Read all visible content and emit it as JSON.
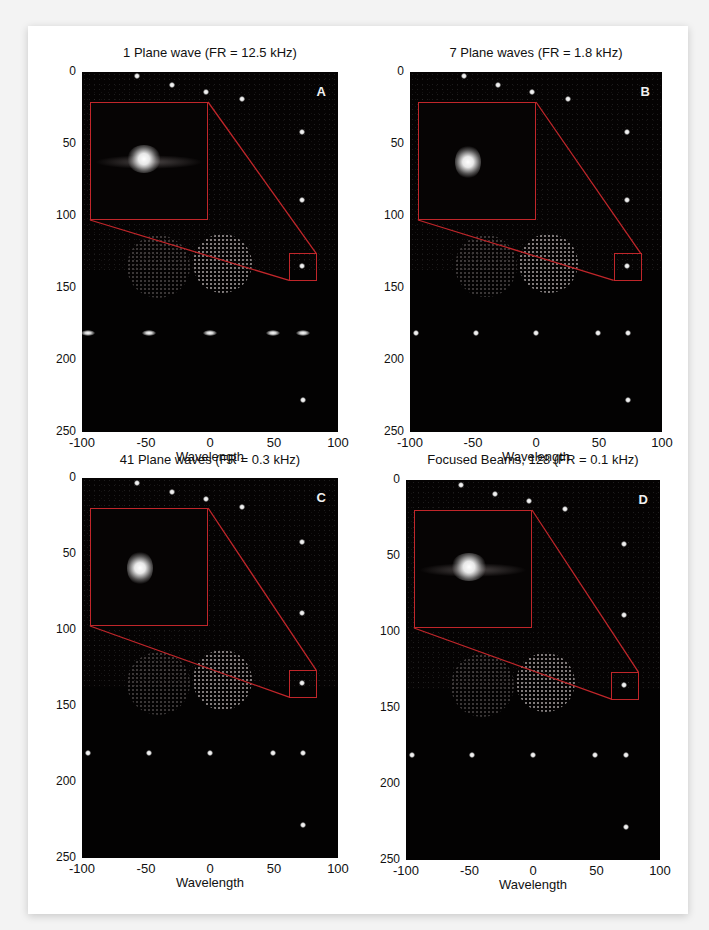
{
  "figure": {
    "panels": [
      {
        "id": "A",
        "letter": "A",
        "title": "1 Plane wave (FR = 12.5 kHz)",
        "xlabel": "Wavelength",
        "inset_style": "sidelobes-wide"
      },
      {
        "id": "B",
        "letter": "B",
        "title": "7 Plane waves (FR = 1.8 kHz)",
        "xlabel": "Wavelength",
        "inset_style": "narrow"
      },
      {
        "id": "C",
        "letter": "C",
        "title": "41 Plane waves (FR = 0.3 kHz)",
        "xlabel": "Wavelength",
        "inset_style": "narrow-clean"
      },
      {
        "id": "D",
        "letter": "D",
        "title": "Focused Beams, 128 (FR = 0.1 kHz)",
        "xlabel": "Wavelength",
        "inset_style": "sidelobes-speckle"
      }
    ],
    "y_ticks": [
      "0",
      "50",
      "100",
      "150",
      "200",
      "250"
    ],
    "x_ticks": [
      "-100",
      "-50",
      "0",
      "50",
      "100"
    ],
    "colors": {
      "inset_border": "#c0262a",
      "image_bg": "#050303",
      "page_bg": "#ffffff"
    }
  },
  "chart_data": [
    {
      "type": "heatmap",
      "title": "1 Plane wave (FR = 12.5 kHz)",
      "panel_label": "A",
      "xlabel": "Wavelength",
      "ylabel": "",
      "xlim": [
        -100,
        100
      ],
      "ylim": [
        250,
        0
      ],
      "x_ticks": [
        -100,
        -50,
        0,
        50,
        100
      ],
      "y_ticks": [
        0,
        50,
        100,
        150,
        200,
        250
      ],
      "point_targets": [
        [
          -57,
          3
        ],
        [
          -30,
          9
        ],
        [
          -3,
          14
        ],
        [
          25,
          19
        ],
        [
          72,
          42
        ],
        [
          72,
          89
        ],
        [
          72,
          135
        ],
        [
          -95,
          181
        ],
        [
          -48,
          181
        ],
        [
          0,
          181
        ],
        [
          49,
          181
        ],
        [
          73,
          181
        ],
        [
          73,
          228
        ]
      ],
      "cysts": [
        {
          "x": -40,
          "z": 135,
          "r": 17,
          "type": "anechoic-faint"
        },
        {
          "x": 10,
          "z": 133,
          "r": 16,
          "type": "hyperechoic"
        }
      ],
      "inset": {
        "zoom_of": [
          72,
          135
        ],
        "note": "wide lateral sidelobes"
      }
    },
    {
      "type": "heatmap",
      "title": "7 Plane waves (FR = 1.8 kHz)",
      "panel_label": "B",
      "xlabel": "Wavelength",
      "ylabel": "",
      "xlim": [
        -100,
        100
      ],
      "ylim": [
        250,
        0
      ],
      "x_ticks": [
        -100,
        -50,
        0,
        50,
        100
      ],
      "y_ticks": [
        0,
        50,
        100,
        150,
        200,
        250
      ],
      "point_targets": [
        [
          -57,
          3
        ],
        [
          -30,
          9
        ],
        [
          -3,
          14
        ],
        [
          25,
          19
        ],
        [
          72,
          42
        ],
        [
          72,
          89
        ],
        [
          72,
          135
        ],
        [
          -95,
          181
        ],
        [
          -48,
          181
        ],
        [
          0,
          181
        ],
        [
          49,
          181
        ],
        [
          73,
          181
        ],
        [
          73,
          228
        ]
      ],
      "cysts": [
        {
          "x": -40,
          "z": 135,
          "r": 17,
          "type": "anechoic-faint"
        },
        {
          "x": 10,
          "z": 133,
          "r": 16,
          "type": "hyperechoic"
        }
      ],
      "inset": {
        "zoom_of": [
          72,
          135
        ],
        "note": "reduced sidelobes"
      }
    },
    {
      "type": "heatmap",
      "title": "41 Plane waves (FR = 0.3 kHz)",
      "panel_label": "C",
      "xlabel": "Wavelength",
      "ylabel": "",
      "xlim": [
        -100,
        100
      ],
      "ylim": [
        250,
        0
      ],
      "x_ticks": [
        -100,
        -50,
        0,
        50,
        100
      ],
      "y_ticks": [
        0,
        50,
        100,
        150,
        200,
        250
      ],
      "point_targets": [
        [
          -57,
          3
        ],
        [
          -30,
          9
        ],
        [
          -3,
          14
        ],
        [
          25,
          19
        ],
        [
          72,
          42
        ],
        [
          72,
          89
        ],
        [
          72,
          135
        ],
        [
          -95,
          181
        ],
        [
          -48,
          181
        ],
        [
          0,
          181
        ],
        [
          49,
          181
        ],
        [
          73,
          181
        ],
        [
          73,
          228
        ]
      ],
      "cysts": [
        {
          "x": -40,
          "z": 135,
          "r": 17,
          "type": "anechoic-faint"
        },
        {
          "x": 10,
          "z": 133,
          "r": 16,
          "type": "hyperechoic"
        }
      ],
      "inset": {
        "zoom_of": [
          72,
          135
        ],
        "note": "clean point spread"
      }
    },
    {
      "type": "heatmap",
      "title": "Focused Beams, 128 (FR = 0.1 kHz)",
      "panel_label": "D",
      "xlabel": "Wavelength",
      "ylabel": "",
      "xlim": [
        -100,
        100
      ],
      "ylim": [
        250,
        0
      ],
      "x_ticks": [
        -100,
        -50,
        0,
        50,
        100
      ],
      "y_ticks": [
        0,
        50,
        100,
        150,
        200,
        250
      ],
      "point_targets": [
        [
          -57,
          3
        ],
        [
          -30,
          9
        ],
        [
          -3,
          14
        ],
        [
          25,
          19
        ],
        [
          72,
          42
        ],
        [
          72,
          89
        ],
        [
          72,
          135
        ],
        [
          -95,
          181
        ],
        [
          -48,
          181
        ],
        [
          0,
          181
        ],
        [
          49,
          181
        ],
        [
          73,
          181
        ],
        [
          73,
          228
        ]
      ],
      "cysts": [
        {
          "x": -40,
          "z": 135,
          "r": 17,
          "type": "anechoic-faint"
        },
        {
          "x": 10,
          "z": 133,
          "r": 16,
          "type": "hyperechoic"
        }
      ],
      "inset": {
        "zoom_of": [
          72,
          135
        ],
        "note": "speckled sidelobe pattern"
      }
    }
  ]
}
